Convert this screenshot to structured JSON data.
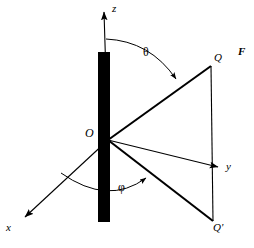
{
  "figure": {
    "kind": "physics-vector-diagram",
    "background_color": "#ffffff",
    "stroke_color": "#000000",
    "rod": {
      "name": "vertical-black-rod",
      "fill_color": "#000000",
      "x": 98,
      "y": 52,
      "width": 12,
      "height": 170
    },
    "origin": {
      "x": 108,
      "y": 140
    },
    "axes": [
      {
        "id": "z",
        "label": "z",
        "from": [
          108,
          140
        ],
        "to": [
          104,
          10
        ],
        "arrow": true
      },
      {
        "id": "y",
        "label": "y",
        "from": [
          108,
          140
        ],
        "to": [
          222,
          168
        ],
        "arrow": true
      },
      {
        "id": "x",
        "label": "x",
        "from": [
          108,
          140
        ],
        "to": [
          22,
          220
        ],
        "arrow": true
      }
    ],
    "points": [
      {
        "id": "Q",
        "label": "Q",
        "x": 211,
        "y": 66
      },
      {
        "id": "Qp",
        "label": "Q'",
        "x": 213,
        "y": 221
      }
    ],
    "rays": [
      {
        "id": "OQ",
        "from": [
          108,
          140
        ],
        "to": [
          211,
          66
        ]
      },
      {
        "id": "OQp",
        "from": [
          108,
          140
        ],
        "to": [
          213,
          221
        ]
      }
    ],
    "segments": [
      {
        "id": "QQp",
        "from": [
          211,
          66
        ],
        "to": [
          213,
          221
        ]
      }
    ],
    "angles": [
      {
        "id": "theta",
        "label": "θ",
        "between": [
          "z",
          "OQ"
        ],
        "label_x": 148,
        "label_y": 52
      },
      {
        "id": "phi",
        "label": "φ",
        "between": [
          "x",
          "OQp"
        ],
        "label_x": 123,
        "label_y": 187
      }
    ],
    "field_label": {
      "id": "F",
      "label": "F",
      "bold": true,
      "italic": true,
      "x": 243,
      "y": 52
    }
  }
}
